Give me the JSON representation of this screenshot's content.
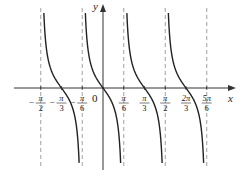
{
  "chart_data": {
    "type": "line",
    "title": "",
    "function": "y = -tan(3x)",
    "xlabel": "x",
    "ylabel": "y",
    "origin_label": "0",
    "xlim": [
      -0.6667,
      1.0
    ],
    "ylim": [
      -4,
      4
    ],
    "grid": false,
    "legend": null,
    "x_ticks": [
      {
        "value": -0.5,
        "label_num": "π",
        "label_den": "2",
        "sign": "−"
      },
      {
        "value": -0.3333,
        "label_num": "π",
        "label_den": "3",
        "sign": "−"
      },
      {
        "value": -0.1667,
        "label_num": "π",
        "label_den": "6",
        "sign": "−"
      },
      {
        "value": 0.1667,
        "label_num": "π",
        "label_den": "6",
        "sign": ""
      },
      {
        "value": 0.3333,
        "label_num": "π",
        "label_den": "3",
        "sign": ""
      },
      {
        "value": 0.5,
        "label_num": "π",
        "label_den": "2",
        "sign": ""
      },
      {
        "value": 0.6667,
        "label_num": "2π",
        "label_den": "3",
        "sign": ""
      },
      {
        "value": 0.8333,
        "label_num": "5π",
        "label_den": "6",
        "sign": ""
      }
    ],
    "asymptotes": [
      -0.5,
      -0.1667,
      0.1667,
      0.5,
      0.8333
    ],
    "asymptote_units": "multiples of π",
    "zeros": [
      -0.3333,
      0,
      0.3333,
      0.6667
    ],
    "branches": [
      {
        "from": -0.5,
        "to": -0.1667,
        "zero": -0.3333
      },
      {
        "from": -0.1667,
        "to": 0.1667,
        "zero": 0
      },
      {
        "from": 0.1667,
        "to": 0.5,
        "zero": 0.3333
      },
      {
        "from": 0.5,
        "to": 0.8333,
        "zero": 0.6667
      }
    ]
  }
}
